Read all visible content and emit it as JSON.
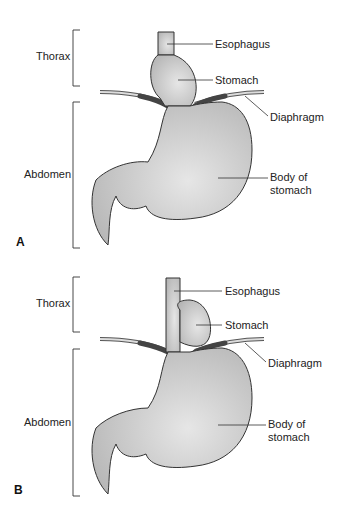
{
  "figure": {
    "panels": [
      {
        "id": "A",
        "letter": "A",
        "regions": {
          "thorax": "Thorax",
          "abdomen": "Abdomen"
        },
        "labels": {
          "esophagus": "Esophagus",
          "stomach": "Stomach",
          "diaphragm": "Diaphragm",
          "body_line1": "Body of",
          "body_line2": "stomach"
        }
      },
      {
        "id": "B",
        "letter": "B",
        "regions": {
          "thorax": "Thorax",
          "abdomen": "Abdomen"
        },
        "labels": {
          "esophagus": "Esophagus",
          "stomach": "Stomach",
          "diaphragm": "Diaphragm",
          "body_line1": "Body of",
          "body_line2": "stomach"
        }
      }
    ]
  }
}
